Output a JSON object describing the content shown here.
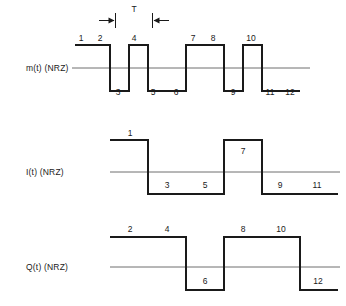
{
  "figure": {
    "title": "",
    "period_symbol": "T"
  },
  "chart_data": {
    "type": "line",
    "title": "",
    "xlabel": "",
    "ylabel": "",
    "grid": false,
    "legend": "none",
    "annotations": [
      {
        "text": "T",
        "meaning": "bit period",
        "x": 134,
        "y": 10
      }
    ],
    "traces": [
      {
        "name": "m(t) (NRZ)",
        "label": "m(t) (NRZ)",
        "bit_period_px": 19,
        "levels": [
          1,
          1,
          -1,
          1,
          -1,
          -1,
          1,
          1,
          -1,
          1,
          -1,
          -1
        ],
        "bits": [
          1,
          2,
          3,
          4,
          5,
          6,
          7,
          8,
          9,
          10,
          11,
          12
        ],
        "top_labels": [
          1,
          2,
          4,
          7,
          8,
          10
        ],
        "bottom_labels": [
          3,
          5,
          6,
          9,
          11,
          12
        ]
      },
      {
        "name": "I(t) (NRZ)",
        "label": "I(t) (NRZ)",
        "bit_period_px": 38,
        "levels": [
          1,
          -1,
          -1,
          1,
          -1,
          -1
        ],
        "bits": [
          1,
          3,
          5,
          7,
          9,
          11
        ],
        "top_labels": [
          1,
          7
        ],
        "bottom_labels": [
          3,
          5,
          9,
          11
        ]
      },
      {
        "name": "Q(t) (NRZ)",
        "label": "Q(t) (NRZ)",
        "bit_period_px": 38,
        "levels": [
          1,
          1,
          -1,
          1,
          1,
          -1
        ],
        "bits": [
          2,
          4,
          6,
          8,
          10,
          12
        ],
        "top_labels": [
          2,
          4,
          8,
          10
        ],
        "bottom_labels": [
          6,
          12
        ]
      }
    ]
  },
  "waveforms": {
    "m": {
      "label": "m(t) (NRZ)",
      "labels": [
        {
          "text": "1",
          "x": 81,
          "y": 33
        },
        {
          "text": "2",
          "x": 100,
          "y": 33
        },
        {
          "text": "3",
          "x": 118,
          "y": 87
        },
        {
          "text": "4",
          "x": 134,
          "y": 33
        },
        {
          "text": "5",
          "x": 153,
          "y": 87
        },
        {
          "text": "6",
          "x": 176,
          "y": 87
        },
        {
          "text": "7",
          "x": 193,
          "y": 33
        },
        {
          "text": "8",
          "x": 213,
          "y": 33
        },
        {
          "text": "9",
          "x": 233,
          "y": 87
        },
        {
          "text": "10",
          "x": 251,
          "y": 33
        },
        {
          "text": "11",
          "x": 270,
          "y": 87
        },
        {
          "text": "12",
          "x": 290,
          "y": 87
        }
      ]
    },
    "i": {
      "label": "I(t) (NRZ)",
      "labels": [
        {
          "text": "1",
          "x": 130,
          "y": 128
        },
        {
          "text": "3",
          "x": 167,
          "y": 180
        },
        {
          "text": "5",
          "x": 205,
          "y": 180
        },
        {
          "text": "7",
          "x": 243,
          "y": 146
        },
        {
          "text": "9",
          "x": 280,
          "y": 180
        },
        {
          "text": "11",
          "x": 317,
          "y": 180
        }
      ]
    },
    "q": {
      "label": "Q(t) (NRZ)",
      "labels": [
        {
          "text": "2",
          "x": 130,
          "y": 224
        },
        {
          "text": "4",
          "x": 167,
          "y": 224
        },
        {
          "text": "6",
          "x": 205,
          "y": 276
        },
        {
          "text": "8",
          "x": 243,
          "y": 224
        },
        {
          "text": "10",
          "x": 281,
          "y": 224
        },
        {
          "text": "12",
          "x": 318,
          "y": 276
        }
      ]
    }
  }
}
